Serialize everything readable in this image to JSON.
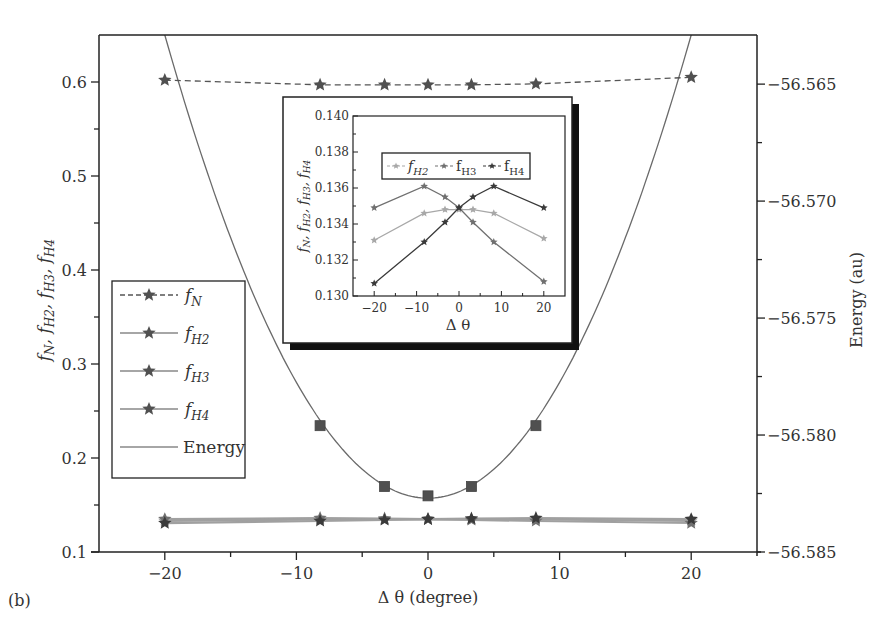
{
  "panel_label": "(b)",
  "chart_data": [
    {
      "id": "main",
      "type": "line",
      "title": "",
      "xlabel": "Δ θ (degree)",
      "ylabel": "f̄N, f̄H2, f̄H3, f̄H4",
      "ylabel_right": "Energy (au)",
      "xlim": [
        -25,
        25
      ],
      "ylim": [
        0.1,
        0.65
      ],
      "ylim_right": [
        -56.585,
        -56.5629
      ],
      "xticks": [
        -20,
        -10,
        0,
        10,
        20
      ],
      "yticks": [
        0.1,
        0.2,
        0.3,
        0.4,
        0.5,
        0.6
      ],
      "yticks_right": [
        -56.585,
        -56.58,
        -56.575,
        -56.57,
        -56.565
      ],
      "ytick_labels": [
        "0.1",
        "0.2",
        "0.3",
        "0.4",
        "0.5",
        "0.6"
      ],
      "ytick_labels_right": [
        "-56.585",
        "-56.580",
        "-56.575",
        "-56.570",
        "-56.565"
      ],
      "grid": false,
      "legend_position": "left-middle",
      "x": [
        -20,
        -8.2,
        -3.3,
        0,
        3.3,
        8.2,
        20
      ],
      "series": [
        {
          "name": "f̄N",
          "sub": "N",
          "style": "dashed",
          "marker": "star",
          "axis": "left",
          "values": [
            0.602,
            0.597,
            0.597,
            0.597,
            0.597,
            0.598,
            0.605
          ]
        },
        {
          "name": "f̄H2",
          "sub": "H2",
          "style": "solid",
          "marker": "star",
          "axis": "left",
          "values": [
            0.1331,
            0.1346,
            0.1348,
            0.1348,
            0.1348,
            0.1346,
            0.1332
          ]
        },
        {
          "name": "f̄H3",
          "sub": "H3",
          "style": "solid",
          "marker": "star",
          "axis": "left",
          "values": [
            0.1349,
            0.1361,
            0.1355,
            0.1349,
            0.1341,
            0.133,
            0.1308
          ]
        },
        {
          "name": "f̄H4",
          "sub": "H4",
          "style": "solid",
          "marker": "star",
          "axis": "left",
          "values": [
            0.1307,
            0.133,
            0.1341,
            0.1349,
            0.1355,
            0.1361,
            0.1349
          ]
        },
        {
          "name": "Energy",
          "style": "solid",
          "marker": "square",
          "axis": "right",
          "x": [
            -8.2,
            -3.3,
            0,
            3.3,
            8.2
          ],
          "values": [
            -56.5796,
            -56.5822,
            -56.5826,
            -56.5822,
            -56.5796
          ],
          "curve": "parabola",
          "curve_min": -56.5827,
          "curve_k": 4.95e-05
        }
      ]
    },
    {
      "id": "inset",
      "type": "line",
      "xlabel": "Δ θ",
      "ylabel": "f̄N, f̄H2, f̄H3, f̄H4",
      "xlim": [
        -25,
        25
      ],
      "ylim": [
        0.13,
        0.14
      ],
      "xticks": [
        -20,
        -10,
        0,
        10,
        20
      ],
      "yticks": [
        0.13,
        0.132,
        0.134,
        0.136,
        0.138,
        0.14
      ],
      "ytick_labels": [
        "0.130",
        "0.132",
        "0.134",
        "0.136",
        "0.138",
        "0.140"
      ],
      "legend_position": "top-center",
      "legend": [
        "f̄H2",
        "f̄H3",
        "f̄H4"
      ],
      "x": [
        -20,
        -8.2,
        -3.3,
        0,
        3.3,
        8.2,
        20
      ],
      "series": [
        {
          "name": "f̄H2",
          "sub": "H2",
          "color": "#a8a8a8",
          "values": [
            0.1331,
            0.1346,
            0.1348,
            0.1348,
            0.1348,
            0.1346,
            0.1332
          ]
        },
        {
          "name": "f̄H3",
          "sub": "H3",
          "color": "#707070",
          "values": [
            0.1349,
            0.1361,
            0.1355,
            0.1349,
            0.1341,
            0.133,
            0.1308
          ]
        },
        {
          "name": "f̄H4",
          "sub": "H4",
          "color": "#3a3a3a",
          "values": [
            0.1307,
            0.133,
            0.1341,
            0.1349,
            0.1355,
            0.1361,
            0.1349
          ]
        }
      ]
    }
  ],
  "legend": {
    "items": [
      {
        "label_main": "f",
        "label_sub": "N",
        "style": "dashed",
        "marker": "star"
      },
      {
        "label_main": "f",
        "label_sub": "H2",
        "style": "solid",
        "marker": "star"
      },
      {
        "label_main": "f",
        "label_sub": "H3",
        "style": "solid",
        "marker": "star"
      },
      {
        "label_main": "f",
        "label_sub": "H4",
        "style": "solid",
        "marker": "star"
      },
      {
        "label_main": "Energy",
        "label_sub": "",
        "style": "solid",
        "marker": "none"
      }
    ]
  },
  "colors": {
    "axis": "#222222",
    "text": "#333333",
    "fN": "#555555",
    "fH2": "#a8a8a8",
    "fH3": "#707070",
    "fH4": "#3a3a3a",
    "energy": "#6a6a6a",
    "marker": "#505050"
  }
}
